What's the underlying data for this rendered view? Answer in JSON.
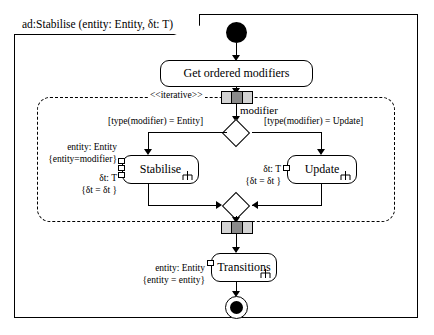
{
  "diagram": {
    "kind": "uml-activity-diagram",
    "frame_title": "ad:Stabilise (entity: Entity, δt: T)",
    "region_stereotype": "<<iterative>>",
    "nodes": {
      "initial": "initial-node",
      "get_ordered_modifiers": "Get ordered modifiers",
      "stabilise": "Stabilise",
      "update": "Update",
      "transitions": "Transitions",
      "final": "activity-final-node"
    },
    "flow_labels": {
      "modifier": "modifier"
    },
    "guards": {
      "entity_branch": "[type(modifier) = Entity]",
      "update_branch": "[type(modifier) = Update]"
    },
    "annotations": {
      "stabilise_entity_pin": "entity: Entity",
      "stabilise_entity_binding": "{entity=modifier}",
      "stabilise_dt_pin": "δt: T",
      "stabilise_dt_binding": "{δt = δt }",
      "update_dt_pin": "δt: T",
      "update_dt_binding": "{δt = δt }",
      "transitions_entity_pin": "entity: Entity",
      "transitions_entity_binding": "{entity = entity}"
    },
    "colors": {
      "stroke": "#000000",
      "background": "#ffffff",
      "expansion_cell_light": "#d3d3d3",
      "expansion_cell_dark": "#8a8a8a"
    }
  }
}
